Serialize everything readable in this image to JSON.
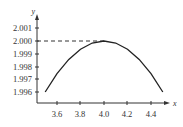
{
  "chart_data": {
    "type": "line",
    "title": "",
    "xlabel": "x",
    "ylabel": "y",
    "xlim": [
      3.5,
      4.5
    ],
    "ylim": [
      1.996,
      2.001
    ],
    "x_ticks": [
      "3.6",
      "3.8",
      "4.0",
      "4.2",
      "4.4"
    ],
    "y_ticks": [
      "2.001",
      "2.000",
      "1.999",
      "1.998",
      "1.997",
      "1.996"
    ],
    "grid": false,
    "legend": null,
    "series": [
      {
        "name": "curve",
        "style": "solid",
        "x": [
          3.5,
          3.6,
          3.7,
          3.8,
          3.9,
          4.0,
          4.1,
          4.2,
          4.3,
          4.4,
          4.5
        ],
        "y": [
          1.996,
          1.99744,
          1.99856,
          1.99936,
          1.99984,
          2.0,
          1.99984,
          1.99936,
          1.99856,
          1.99744,
          1.996
        ]
      }
    ],
    "annotations": [
      {
        "type": "dashed-horizontal-line",
        "y": 2.0,
        "from_x": 3.5,
        "to_x": 4.0,
        "description": "dashed line from y-axis to the maximum at y = 2.000"
      }
    ]
  },
  "labels": {
    "x_axis": "x",
    "y_axis": "y",
    "x_ticks": [
      "3.6",
      "3.8",
      "4.0",
      "4.2",
      "4.4"
    ],
    "y_ticks": [
      "2.001",
      "2.000",
      "1.999",
      "1.998",
      "1.997",
      "1.996"
    ]
  },
  "colors": {
    "axis": "#333333",
    "curve": "#222222",
    "text": "#333333"
  }
}
